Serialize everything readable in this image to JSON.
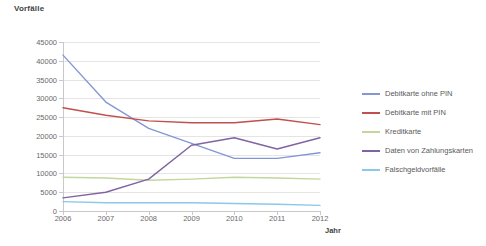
{
  "chart_data": {
    "type": "line",
    "title": "",
    "ylabel": "Vorfälle",
    "xlabel": "Jahr",
    "x": [
      2006,
      2007,
      2008,
      2009,
      2010,
      2011,
      2012
    ],
    "categories": [
      "2006",
      "2007",
      "2008",
      "2009",
      "2010",
      "2011",
      "2012"
    ],
    "ylim": [
      0,
      45000
    ],
    "ytick_labels": [
      "0",
      "5000",
      "10000",
      "15000",
      "20000",
      "25000",
      "30000",
      "35000",
      "40000",
      "45000"
    ],
    "ytick_values": [
      0,
      5000,
      10000,
      15000,
      20000,
      25000,
      30000,
      35000,
      40000,
      45000
    ],
    "grid": true,
    "legend_position": "right",
    "series": [
      {
        "name": "Debitkarte ohne PIN",
        "color": "#8497d4",
        "values": [
          41500,
          29000,
          22000,
          18000,
          14000,
          14000,
          15500
        ]
      },
      {
        "name": "Debitkarte mit PIN",
        "color": "#c0504d",
        "values": [
          27500,
          25500,
          24000,
          23500,
          23500,
          24500,
          23000
        ]
      },
      {
        "name": "Kreditkarte",
        "color": "#c3d69b",
        "values": [
          9000,
          8800,
          8200,
          8500,
          9000,
          8800,
          8500
        ]
      },
      {
        "name": "Daten von Zahlungskarten",
        "color": "#8064a2",
        "values": [
          3500,
          5000,
          8500,
          17500,
          19500,
          16500,
          19500
        ]
      },
      {
        "name": "Falschgeldvorfälle",
        "color": "#8cc8e8",
        "values": [
          2500,
          2200,
          2200,
          2200,
          2000,
          1800,
          1500
        ]
      }
    ]
  }
}
